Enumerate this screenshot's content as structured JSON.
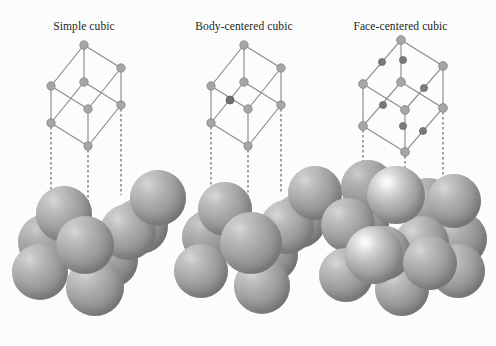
{
  "figure": {
    "background_color": "#fcfcfc",
    "line_color": "#8c8c8c",
    "node_color": "#a6a6a6",
    "node_dark_color": "#6e6e6e",
    "dash_color": "#5a5a5a",
    "label_color": "#231f20",
    "sphere_color": "#a0a0a0"
  },
  "panels": [
    {
      "id": "simple-cubic",
      "label": "Simple cubic",
      "lattice": {
        "corner_atoms": 8,
        "interior_atoms": 0,
        "face_atoms": 0,
        "nodes": [
          {
            "x": 51,
            "y": 123,
            "r": 4.2,
            "shade": "light"
          },
          {
            "x": 51,
            "y": 86,
            "r": 4.2,
            "shade": "light"
          },
          {
            "x": 88,
            "y": 146,
            "r": 4.2,
            "shade": "light"
          },
          {
            "x": 88,
            "y": 109,
            "r": 4.2,
            "shade": "light"
          },
          {
            "x": 121,
            "y": 105,
            "r": 4.2,
            "shade": "light"
          },
          {
            "x": 121,
            "y": 68,
            "r": 4.2,
            "shade": "light"
          },
          {
            "x": 84,
            "y": 82,
            "r": 4.2,
            "shade": "light"
          },
          {
            "x": 84,
            "y": 45,
            "r": 4.2,
            "shade": "light"
          }
        ]
      },
      "drop_lines": [
        {
          "x": 51,
          "y1": 127,
          "y2": 205
        },
        {
          "x": 88,
          "y1": 150,
          "y2": 225
        },
        {
          "x": 121,
          "y1": 109,
          "y2": 195
        }
      ],
      "packing": {
        "sphere_count": 9,
        "description": "Eight corner spheres in contact forming a simple cubic cluster"
      }
    },
    {
      "id": "body-centered-cubic",
      "label": "Body-centered cubic",
      "lattice": {
        "corner_atoms": 8,
        "interior_atoms": 1,
        "face_atoms": 0,
        "nodes": [
          {
            "x": 51,
            "y": 123,
            "r": 4.2,
            "shade": "light"
          },
          {
            "x": 51,
            "y": 86,
            "r": 4.2,
            "shade": "light"
          },
          {
            "x": 88,
            "y": 146,
            "r": 4.2,
            "shade": "light"
          },
          {
            "x": 88,
            "y": 109,
            "r": 4.2,
            "shade": "light"
          },
          {
            "x": 121,
            "y": 105,
            "r": 4.2,
            "shade": "light"
          },
          {
            "x": 121,
            "y": 68,
            "r": 4.2,
            "shade": "light"
          },
          {
            "x": 84,
            "y": 82,
            "r": 4.2,
            "shade": "light"
          },
          {
            "x": 84,
            "y": 45,
            "r": 4.2,
            "shade": "light"
          },
          {
            "x": 70,
            "y": 100,
            "r": 4.0,
            "shade": "dark"
          }
        ]
      },
      "drop_lines": [
        {
          "x": 51,
          "y1": 127,
          "y2": 200
        },
        {
          "x": 88,
          "y1": 150,
          "y2": 222
        },
        {
          "x": 121,
          "y1": 109,
          "y2": 192
        }
      ],
      "packing": {
        "sphere_count": 9,
        "description": "Eight corner spheres with one central sphere touching all corners"
      }
    },
    {
      "id": "face-centered-cubic",
      "label": "Face-centered cubic",
      "lattice": {
        "corner_atoms": 8,
        "interior_atoms": 0,
        "face_atoms": 6,
        "nodes": [
          {
            "x": 58,
            "y": 126,
            "r": 4.4,
            "shade": "light"
          },
          {
            "x": 58,
            "y": 84,
            "r": 4.4,
            "shade": "light"
          },
          {
            "x": 100,
            "y": 152,
            "r": 4.4,
            "shade": "light"
          },
          {
            "x": 100,
            "y": 110,
            "r": 4.4,
            "shade": "light"
          },
          {
            "x": 138,
            "y": 108,
            "r": 4.4,
            "shade": "light"
          },
          {
            "x": 138,
            "y": 66,
            "r": 4.4,
            "shade": "light"
          },
          {
            "x": 96,
            "y": 82,
            "r": 4.4,
            "shade": "light"
          },
          {
            "x": 96,
            "y": 40,
            "r": 4.4,
            "shade": "light"
          },
          {
            "x": 78,
            "y": 105,
            "r": 3.6,
            "shade": "dark"
          },
          {
            "x": 118,
            "y": 131,
            "r": 3.6,
            "shade": "dark"
          },
          {
            "x": 119,
            "y": 88,
            "r": 3.6,
            "shade": "dark"
          },
          {
            "x": 77,
            "y": 62,
            "r": 3.6,
            "shade": "dark"
          },
          {
            "x": 98,
            "y": 126,
            "r": 3.6,
            "shade": "dark"
          },
          {
            "x": 98,
            "y": 60,
            "r": 3.6,
            "shade": "dark"
          }
        ]
      },
      "drop_lines": [
        {
          "x": 58,
          "y1": 130,
          "y2": 190
        },
        {
          "x": 100,
          "y1": 156,
          "y2": 215
        },
        {
          "x": 138,
          "y1": 112,
          "y2": 182
        }
      ],
      "packing": {
        "sphere_count": 14,
        "description": "Corner spheres plus bright face-centered spheres"
      }
    }
  ]
}
